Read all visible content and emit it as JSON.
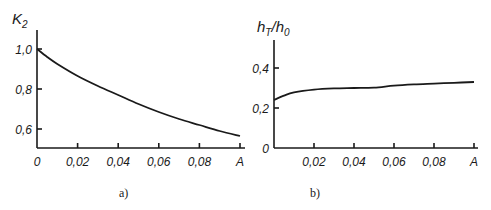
{
  "chart_data": [
    {
      "type": "line",
      "panel": "a",
      "caption": "a)",
      "ylabel": "K",
      "ylabel_sub": "2",
      "xlabel": "A",
      "x_ticks": [
        0,
        0.02,
        0.04,
        0.06,
        0.08,
        0.1
      ],
      "x_tick_labels": [
        "0",
        "0,02",
        "0,04",
        "0,06",
        "0,08",
        "A"
      ],
      "y_ticks": [
        1.0,
        0.8,
        0.6
      ],
      "y_tick_labels": [
        "1,0",
        "0,8",
        "0,6"
      ],
      "xlim": [
        0,
        0.1
      ],
      "ylim": [
        0.5,
        1.1
      ],
      "grid": false,
      "series": [
        {
          "name": "K2",
          "x": [
            0,
            0.005,
            0.01,
            0.02,
            0.03,
            0.04,
            0.05,
            0.06,
            0.07,
            0.08,
            0.09,
            0.1
          ],
          "y": [
            1.0,
            0.96,
            0.925,
            0.865,
            0.815,
            0.77,
            0.725,
            0.685,
            0.65,
            0.62,
            0.59,
            0.565
          ]
        }
      ]
    },
    {
      "type": "line",
      "panel": "b",
      "caption": "b)",
      "ylabel": "h",
      "ylabel_sub": "T",
      "ylabel_sep": "/",
      "ylabel2": "h",
      "ylabel2_sub": "0",
      "xlabel": "A",
      "x_ticks": [
        0.02,
        0.04,
        0.06,
        0.08,
        0.1
      ],
      "x_tick_labels": [
        "0,02",
        "0,04",
        "0,06",
        "0,08",
        "A"
      ],
      "y_ticks": [
        0,
        0.2,
        0.4
      ],
      "y_tick_labels": [
        "0",
        "0,2",
        "0,4"
      ],
      "xlim": [
        0,
        0.1
      ],
      "ylim": [
        0,
        0.55
      ],
      "grid": false,
      "series": [
        {
          "name": "hT/h0",
          "x": [
            0,
            0.005,
            0.01,
            0.02,
            0.03,
            0.04,
            0.05,
            0.06,
            0.07,
            0.08,
            0.09,
            0.1
          ],
          "y": [
            0.24,
            0.262,
            0.278,
            0.292,
            0.298,
            0.3,
            0.302,
            0.312,
            0.318,
            0.322,
            0.326,
            0.33
          ]
        }
      ]
    }
  ]
}
